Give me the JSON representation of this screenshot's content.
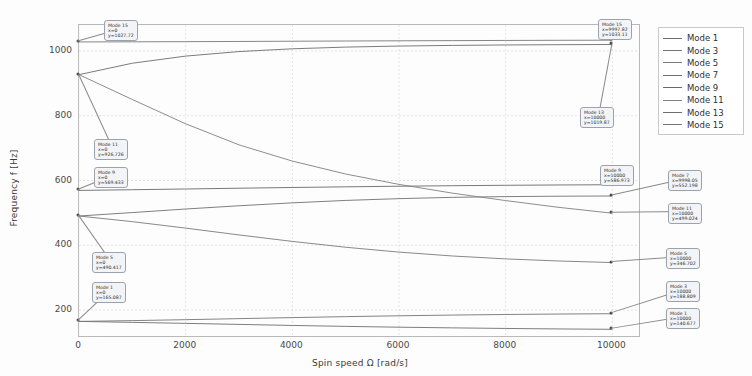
{
  "chart_data": {
    "type": "line",
    "title": "",
    "xlabel": "Spin speed Ω [rad/s]",
    "ylabel": "Frequency f [Hz]",
    "xlim": [
      0,
      10500
    ],
    "ylim": [
      120,
      1080
    ],
    "xticks": [
      0,
      2000,
      4000,
      6000,
      8000,
      10000
    ],
    "xtick_labels": [
      "0",
      "2000",
      "4000",
      "6000",
      "8000",
      "10000"
    ],
    "yticks": [
      200,
      400,
      600,
      800,
      1000
    ],
    "ytick_labels": [
      "200",
      "400",
      "600",
      "800",
      "1000"
    ],
    "grid": true,
    "legend_position": "right",
    "x": [
      0,
      1000,
      2000,
      3000,
      4000,
      5000,
      6000,
      7000,
      8000,
      9000,
      10000
    ],
    "series": [
      {
        "name": "Mode 1",
        "color": "#6f6f6f",
        "values": [
          165.087,
          162.1,
          159.0,
          155.8,
          152.6,
          149.7,
          147.2,
          145.1,
          143.3,
          141.8,
          140.677
        ]
      },
      {
        "name": "Mode 3",
        "color": "#757575",
        "values": [
          165.087,
          167.5,
          170.4,
          173.6,
          176.8,
          179.8,
          182.4,
          184.6,
          186.4,
          187.8,
          188.809
        ]
      },
      {
        "name": "Mode 5",
        "color": "#7a7a7a",
        "values": [
          490.417,
          473.0,
          453.0,
          432.0,
          412.0,
          394.0,
          379.0,
          367.0,
          358.0,
          351.5,
          346.702
        ]
      },
      {
        "name": "Mode 7",
        "color": "#707070",
        "values": [
          490.417,
          501.0,
          512.0,
          522.0,
          531.0,
          538.5,
          544.0,
          548.0,
          550.3,
          551.5,
          552.198
        ]
      },
      {
        "name": "Mode 9",
        "color": "#6a6a6a",
        "values": [
          569.433,
          571.5,
          573.8,
          576.2,
          578.4,
          580.5,
          582.3,
          583.9,
          585.2,
          586.2,
          586.973
        ]
      },
      {
        "name": "Mode 11",
        "color": "#808080",
        "values": [
          926.726,
          850.0,
          775.0,
          710.0,
          660.0,
          620.0,
          588.0,
          561.0,
          538.0,
          517.0,
          499.024
        ]
      },
      {
        "name": "Mode 13",
        "color": "#6d6d6d",
        "values": [
          926.726,
          962.0,
          984.0,
          998.0,
          1006.5,
          1011.8,
          1015.0,
          1017.0,
          1018.4,
          1019.2,
          1019.87
        ]
      },
      {
        "name": "Mode 15",
        "color": "#787878",
        "values": [
          1027.72,
          1028.1,
          1028.6,
          1029.2,
          1029.9,
          1030.6,
          1031.2,
          1031.8,
          1032.3,
          1032.8,
          1033.11
        ]
      }
    ],
    "annotations": [
      {
        "mode": "Mode 15",
        "x_text": "x=0",
        "y_text": "y=1027.72",
        "x": 0,
        "y": 1027.72
      },
      {
        "mode": "Mode 11",
        "x_text": "x=0",
        "y_text": "y=926.726",
        "x": 0,
        "y": 926.726
      },
      {
        "mode": "Mode 9",
        "x_text": "x=0",
        "y_text": "y=569.433",
        "x": 0,
        "y": 569.433
      },
      {
        "mode": "Mode 5",
        "x_text": "x=0",
        "y_text": "y=490.417",
        "x": 0,
        "y": 490.417
      },
      {
        "mode": "Mode 1",
        "x_text": "x=0",
        "y_text": "y=165.087",
        "x": 0,
        "y": 165.087
      },
      {
        "mode": "Mode 15",
        "x_text": "x=9997.82",
        "y_text": "y=1033.11",
        "x": 10000,
        "y": 1033.11
      },
      {
        "mode": "Mode 13",
        "x_text": "x=10000",
        "y_text": "y=1019.87",
        "x": 10000,
        "y": 1019.87
      },
      {
        "mode": "Mode 9",
        "x_text": "x=10000",
        "y_text": "y=586.973",
        "x": 10000,
        "y": 586.973
      },
      {
        "mode": "Mode 7",
        "x_text": "x=9998.05",
        "y_text": "y=552.198",
        "x": 10000,
        "y": 552.198
      },
      {
        "mode": "Mode 11",
        "x_text": "x=10000",
        "y_text": "y=499.024",
        "x": 10000,
        "y": 499.024
      },
      {
        "mode": "Mode 5",
        "x_text": "x=10000",
        "y_text": "y=346.702",
        "x": 10000,
        "y": 346.702
      },
      {
        "mode": "Mode 3",
        "x_text": "x=10000",
        "y_text": "y=188.809",
        "x": 10000,
        "y": 188.809
      },
      {
        "mode": "Mode 1",
        "x_text": "x=10000",
        "y_text": "y=140.677",
        "x": 10000,
        "y": 140.677
      }
    ],
    "annotation_boxes": [
      {
        "idx": 0,
        "left": 104,
        "top": 20,
        "anchor_px": [
          86,
          70
        ]
      },
      {
        "idx": 1,
        "left": 94,
        "top": 139,
        "anchor_px": [
          82,
          98
        ]
      },
      {
        "idx": 2,
        "left": 94,
        "top": 167,
        "anchor_px": [
          82,
          203
        ]
      },
      {
        "idx": 3,
        "left": 92,
        "top": 252,
        "anchor_px": [
          81,
          226
        ]
      },
      {
        "idx": 4,
        "left": 92,
        "top": 282,
        "anchor_px": [
          81,
          313
        ]
      },
      {
        "idx": 5,
        "left": 598,
        "top": 19,
        "anchor_px": [
          633,
          68
        ]
      },
      {
        "idx": 6,
        "left": 580,
        "top": 107,
        "anchor_px": [
          634,
          72
        ]
      },
      {
        "idx": 7,
        "left": 600,
        "top": 165,
        "anchor_px": [
          634,
          198
        ]
      },
      {
        "idx": 8,
        "left": 668,
        "top": 170,
        "anchor_px": [
          636,
          208
        ]
      },
      {
        "idx": 9,
        "left": 668,
        "top": 203,
        "anchor_px": [
          636,
          223
        ]
      },
      {
        "idx": 10,
        "left": 666,
        "top": 248,
        "anchor_px": [
          636,
          272
        ]
      },
      {
        "idx": 11,
        "left": 666,
        "top": 281,
        "anchor_px": [
          636,
          322
        ]
      },
      {
        "idx": 12,
        "left": 666,
        "top": 308,
        "anchor_px": [
          636,
          330
        ]
      }
    ]
  }
}
